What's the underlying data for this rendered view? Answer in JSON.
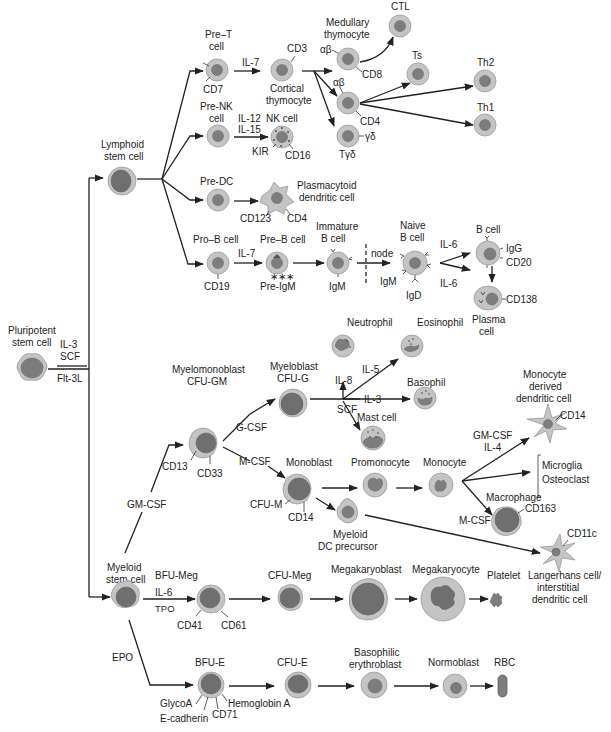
{
  "colors": {
    "cell_cytoplasm": "#c4c4c4",
    "cell_nucleus": "#7d7d7d",
    "line": "#222222",
    "background": "#ffffff"
  },
  "root": {
    "pluripotent": {
      "label_1": "Pluripotent",
      "label_2": "stem cell"
    },
    "factors": {
      "f1": "IL-3",
      "f2": "SCF",
      "f3": "Flt-3L"
    }
  },
  "lymphoid": {
    "stem": {
      "label_1": "Lymphoid",
      "label_2": "stem cell"
    },
    "pre_t": {
      "label_1": "Pre–T",
      "label_2": "cell",
      "marker": "CD7",
      "factor": "IL-7"
    },
    "cortical": {
      "label_1": "Cortical",
      "label_2": "thymocyte",
      "marker": "CD3"
    },
    "medullary": {
      "label_1": "Medullary",
      "label_2": "thymocyte",
      "ab": "αβ",
      "marker": "CD8"
    },
    "cd4_cell": {
      "ab": "αβ",
      "marker": "CD4"
    },
    "tgd": {
      "label": "Tγδ",
      "marker": "γδ"
    },
    "ctl": "CTL",
    "ts": "Ts",
    "th2": "Th2",
    "th1": "Th1",
    "pre_nk": {
      "label_1": "Pre-NK",
      "label_2": "cell",
      "factor_1": "IL-12",
      "factor_2": "IL-15"
    },
    "nk": {
      "label": "NK cell",
      "marker_1": "KIR",
      "marker_2": "CD16"
    },
    "pre_dc": {
      "label": "Pre-DC"
    },
    "pdc": {
      "label_1": "Plasmacytoid",
      "label_2": "dendritic cell",
      "marker_1": "CD123",
      "marker_2": "CD4"
    },
    "pro_b": {
      "label": "Pro–B cell",
      "marker": "CD19",
      "factor": "IL-7"
    },
    "pre_b": {
      "label": "Pre–B cell",
      "marker": "Pre-IgM"
    },
    "immature_b": {
      "label_1": "Immature",
      "label_2": "B cell",
      "marker": "IgM"
    },
    "node_label": "node",
    "naive_b": {
      "label_1": "Naive",
      "label_2": "B cell",
      "marker_1": "IgM",
      "marker_2": "IgD"
    },
    "il6_top": "IL-6",
    "il6_bottom": "IL-6",
    "b_cell": {
      "label": "B cell",
      "marker_1": "IgG",
      "marker_2": "CD20"
    },
    "plasma": {
      "label_1": "Plasma",
      "label_2": "cell",
      "marker": "CD138"
    }
  },
  "myeloid": {
    "stem": {
      "label_1": "Myeloid",
      "label_2": "stem cell"
    },
    "gm_csf": "GM-CSF",
    "myelomonoblast": {
      "label_1": "Myelomonoblast",
      "label_2": "CFU-GM",
      "marker_1": "CD13",
      "marker_2": "CD33"
    },
    "g_csf": "G-CSF",
    "m_csf": "M-CSF",
    "myeloblast": {
      "label_1": "Myeloblast",
      "label_2": "CFU-G"
    },
    "il8": "IL-8",
    "il5": "IL-5",
    "il3": "IL-3",
    "scf": "SCF",
    "neutrophil": "Neutrophil",
    "eosinophil": "Eosinophil",
    "basophil": "Basophil",
    "mast_cell": "Mast cell",
    "monoblast": {
      "label": "Monoblast",
      "marker_1": "CFU-M",
      "marker_2": "CD14"
    },
    "promonocyte": "Promonocyte",
    "monocyte": "Monocyte",
    "mo_dc": {
      "label_1": "Monocyte",
      "label_2": "derived",
      "label_3": "dendritic cell",
      "marker": "CD14",
      "factor_1": "GM-CSF",
      "factor_2": "IL-4"
    },
    "microglia": "Microglia",
    "osteoclast": "Osteoclast",
    "macrophage": {
      "label": "Macrophage",
      "marker": "CD163",
      "factor": "M-CSF"
    },
    "myeloid_dc": {
      "label_1": "Myeloid",
      "label_2": "DC precursor"
    },
    "langerhans": {
      "label_1": "Langerhans cell/",
      "label_2": "interstitial",
      "label_3": "dendritic cell",
      "marker": "CD11c"
    },
    "bfu_meg": {
      "label": "BFU-Meg",
      "factor_1": "IL-6",
      "factor_2": "TPO",
      "marker_1": "CD41",
      "marker_2": "CD61"
    },
    "cfu_meg": "CFU-Meg",
    "megakaryoblast": "Megakaryoblast",
    "megakaryocyte": "Megakaryocyte",
    "platelet": "Platelet",
    "epo": "EPO",
    "bfu_e": {
      "label": "BFU-E",
      "marker_1": "GlycoA",
      "marker_2": "E-cadherin",
      "marker_3": "CD71",
      "marker_4": "Hemoglobin A"
    },
    "cfu_e": "CFU-E",
    "baso_erythro": {
      "label_1": "Basophilic",
      "label_2": "erythroblast"
    },
    "normoblast": "Normoblast",
    "rbc": "RBC"
  }
}
